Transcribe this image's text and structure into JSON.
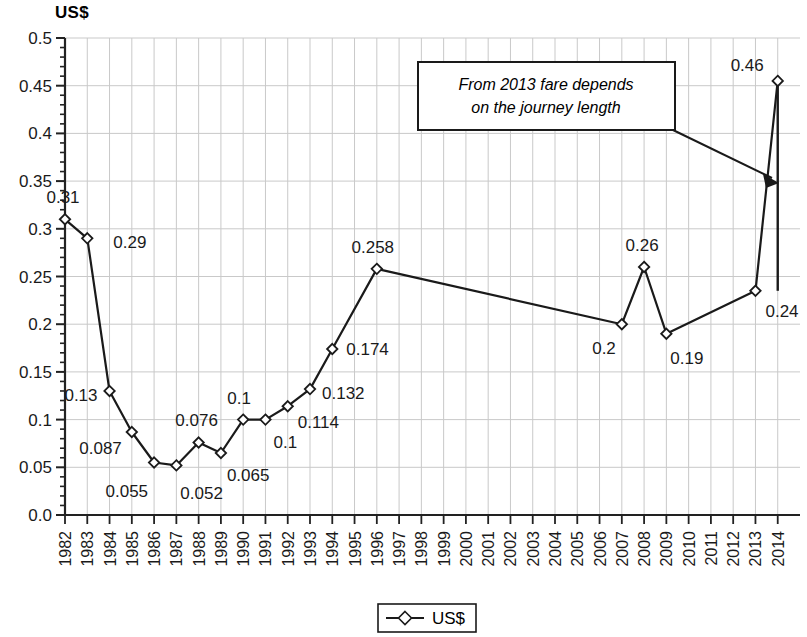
{
  "chart_data": {
    "type": "line",
    "title": "US$",
    "xlabel": "",
    "ylabel": "US$",
    "ylim": [
      0,
      0.5
    ],
    "grid": true,
    "legend_position": "bottom",
    "legend_entries": [
      "US$"
    ],
    "y_ticks": [
      "0.0",
      "0.05",
      "0.1",
      "0.15",
      "0.2",
      "0.25",
      "0.3",
      "0.35",
      "0.4",
      "0.45",
      "0.5"
    ],
    "y_tick_values": [
      0,
      0.05,
      0.1,
      0.15,
      0.2,
      0.25,
      0.3,
      0.35,
      0.4,
      0.45,
      0.5
    ],
    "categories": [
      "1982",
      "1983",
      "1984",
      "1985",
      "1986",
      "1987",
      "1988",
      "1989",
      "1990",
      "1991",
      "1992",
      "1993",
      "1994",
      "1995",
      "1996",
      "1997",
      "1998",
      "1999",
      "2000",
      "2001",
      "2002",
      "2003",
      "2004",
      "2005",
      "2006",
      "2007",
      "2008",
      "2009",
      "2010",
      "2011",
      "2012",
      "2013",
      "2014"
    ],
    "series": [
      {
        "name": "US$",
        "values": [
          0.31,
          0.29,
          0.13,
          0.087,
          0.055,
          0.052,
          0.076,
          0.065,
          0.1,
          0.1,
          0.114,
          0.132,
          0.174,
          null,
          0.258,
          null,
          null,
          null,
          null,
          null,
          null,
          null,
          null,
          null,
          null,
          0.2,
          0.26,
          0.19,
          null,
          null,
          null,
          0.235,
          0.455
        ]
      }
    ],
    "point_labels": [
      {
        "category": "1982",
        "text": "0.31",
        "value": 0.31
      },
      {
        "category": "1983",
        "text": "0.29",
        "value": 0.29
      },
      {
        "category": "1984",
        "text": "0.13",
        "value": 0.13
      },
      {
        "category": "1985",
        "text": "0.087",
        "value": 0.087
      },
      {
        "category": "1986",
        "text": "0.055",
        "value": 0.055
      },
      {
        "category": "1987",
        "text": "0.052",
        "value": 0.052
      },
      {
        "category": "1988",
        "text": "0.076",
        "value": 0.076
      },
      {
        "category": "1989",
        "text": "0.065",
        "value": 0.065
      },
      {
        "category": "1990",
        "text": "0.1",
        "value": 0.1
      },
      {
        "category": "1991",
        "text": "0.1",
        "value": 0.1
      },
      {
        "category": "1992",
        "text": "0.114",
        "value": 0.114
      },
      {
        "category": "1993",
        "text": "0.132",
        "value": 0.132
      },
      {
        "category": "1994",
        "text": "0.174",
        "value": 0.174
      },
      {
        "category": "1996",
        "text": "0.258",
        "value": 0.258
      },
      {
        "category": "2007",
        "text": "0.2",
        "value": 0.2
      },
      {
        "category": "2008",
        "text": "0.26",
        "value": 0.26
      },
      {
        "category": "2009",
        "text": "0.19",
        "value": 0.19
      },
      {
        "category": "2013",
        "text": "0.24",
        "value": 0.235
      },
      {
        "category": "2014",
        "text": "0.46",
        "value": 0.455
      }
    ],
    "range_bar": {
      "category": "2014",
      "low": 0.235,
      "high": 0.455
    },
    "annotations": [
      {
        "text_line_1": "From 2013 fare depends",
        "text_line_2": "on the journey length",
        "points_to": "2014"
      }
    ]
  },
  "colors": {
    "line": "#1a1a1a",
    "marker_fill": "#ffffff",
    "grid": "#c9c9c9",
    "axis": "#222222",
    "text": "#1a1a1a",
    "background": "#ffffff"
  }
}
